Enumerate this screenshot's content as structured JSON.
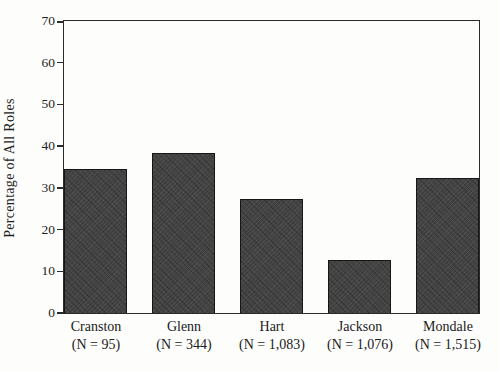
{
  "figure": {
    "background_color": "#fdfdfc",
    "axis_color": "#2b2b2b",
    "text_color": "#202020"
  },
  "chart_data": {
    "type": "bar",
    "title": "",
    "xlabel": "",
    "ylabel": "Percentage of All Roles",
    "ylim": [
      0,
      70
    ],
    "yticks": [
      0,
      10,
      20,
      30,
      40,
      50,
      60,
      70
    ],
    "grid": false,
    "legend": null,
    "frame": "full-box",
    "bar_color": "#434343",
    "bar_border_color": "#161616",
    "categories": [
      "Cranston",
      "Glenn",
      "Hart",
      "Jackson",
      "Mondale"
    ],
    "category_sublabels": [
      "(N = 95)",
      "(N = 344)",
      "(N = 1,083)",
      "(N = 1,076)",
      "(N = 1,515)"
    ],
    "values": [
      34.6,
      38.4,
      27.3,
      12.8,
      32.3
    ]
  }
}
